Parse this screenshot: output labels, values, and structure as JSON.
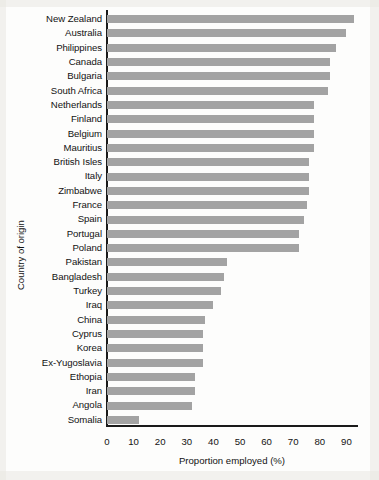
{
  "chart_data": {
    "type": "bar",
    "orientation": "horizontal",
    "title": "",
    "xlabel": "Proportion employed (%)",
    "ylabel": "Country of origin",
    "xlim": [
      0,
      95
    ],
    "xticks": [
      0,
      10,
      20,
      30,
      40,
      50,
      60,
      70,
      80,
      90
    ],
    "grid": false,
    "legend": null,
    "bar_color": "#a3a3a3",
    "axis_color": "#1a1a1a",
    "categories": [
      "New Zealand",
      "Australia",
      "Philippines",
      "Canada",
      "Bulgaria",
      "South Africa",
      "Netherlands",
      "Finland",
      "Belgium",
      "Mauritius",
      "British Isles",
      "Italy",
      "Zimbabwe",
      "France",
      "Spain",
      "Portugal",
      "Poland",
      "Pakistan",
      "Bangladesh",
      "Turkey",
      "Iraq",
      "China",
      "Cyprus",
      "Korea",
      "Ex-Yugoslavia",
      "Ethopia",
      "Iran",
      "Angola",
      "Somalia"
    ],
    "values": [
      93,
      90,
      86,
      84,
      84,
      83,
      78,
      78,
      78,
      78,
      76,
      76,
      76,
      75,
      74,
      72,
      72,
      45,
      44,
      43,
      40,
      37,
      36,
      36,
      36,
      33,
      33,
      32,
      12
    ]
  }
}
